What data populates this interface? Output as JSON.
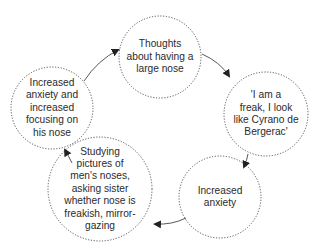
{
  "diagram": {
    "type": "cycle",
    "colors": {
      "stroke": "#444444",
      "text": "#2b2b2b",
      "background": "#ffffff"
    },
    "nodes": [
      {
        "id": "n1",
        "label": "Thoughts\nabout having a\nlarge nose"
      },
      {
        "id": "n2",
        "label": "'I am a\nfreak, I look\nlike Cyrano de\nBergerac'"
      },
      {
        "id": "n3",
        "label": "Increased\nanxiety"
      },
      {
        "id": "n4",
        "label": "Studying\npictures of\nmen's noses,\nasking sister\nwhether nose is\nfreakish, mirror-\ngazing"
      },
      {
        "id": "n5",
        "label": "Increased\nanxiety and\nincreased\nfocusing on\nhis nose"
      }
    ],
    "edges": [
      {
        "from": "n1",
        "to": "n2"
      },
      {
        "from": "n2",
        "to": "n3"
      },
      {
        "from": "n3",
        "to": "n4"
      },
      {
        "from": "n4",
        "to": "n5"
      },
      {
        "from": "n5",
        "to": "n1"
      }
    ]
  }
}
